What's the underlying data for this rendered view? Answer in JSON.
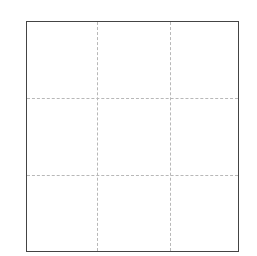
{
  "grid": {
    "rows": 3,
    "cols": 3,
    "border_color": "#444444",
    "gridline_color": "#b8b8b8",
    "gridline_style": "dashed",
    "cells": [
      [
        "",
        "",
        ""
      ],
      [
        "",
        "",
        ""
      ],
      [
        "",
        "",
        ""
      ]
    ]
  }
}
